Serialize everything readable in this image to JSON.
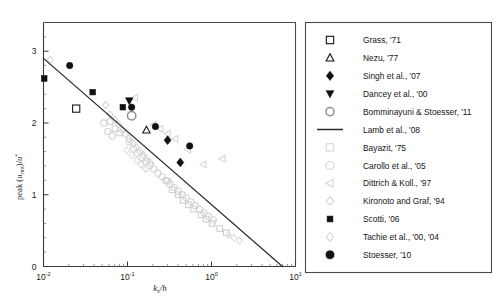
{
  "chart_data": {
    "type": "scatter",
    "title": "",
    "xlabel": "k_s/h",
    "ylabel": "peak (u_rms)/u*",
    "xscale": "log",
    "yscale": "linear",
    "xlim": [
      0.01,
      10
    ],
    "ylim": [
      0,
      3.4
    ],
    "grid": false,
    "legend_position": "right-outside",
    "xticks": [
      {
        "value": 0.01,
        "mantissa": "10",
        "exponent": "-2"
      },
      {
        "value": 0.1,
        "mantissa": "10",
        "exponent": "-1"
      },
      {
        "value": 1,
        "mantissa": "10",
        "exponent": "0"
      },
      {
        "value": 10,
        "mantissa": "10",
        "exponent": "1"
      }
    ],
    "yticks": [
      0,
      1,
      2,
      3
    ],
    "fit_line": {
      "name": "Lamb et al., '08",
      "x_start": 0.01,
      "y_start": 2.9,
      "x_end": 7.0,
      "y_end": 0.0
    },
    "series": [
      {
        "name": "Grass, '71",
        "marker": "square-open",
        "color": "#1a1a1a",
        "size": 7.2,
        "emphasis": "dark",
        "points": [
          [
            0.0245,
            2.2
          ]
        ]
      },
      {
        "name": "Nezu, '77",
        "marker": "triangle-up-open",
        "color": "#1a1a1a",
        "size": 7.0,
        "emphasis": "dark",
        "points": [
          [
            0.168,
            1.9
          ]
        ]
      },
      {
        "name": "Singh et al., '07",
        "marker": "diamond-filled",
        "color": "#111111",
        "size": 7.0,
        "emphasis": "dark",
        "points": [
          [
            0.3,
            1.76
          ],
          [
            0.425,
            1.45
          ]
        ]
      },
      {
        "name": "Dancey et al., '00",
        "marker": "triangle-down-filled",
        "color": "#111111",
        "size": 7.2,
        "emphasis": "dark",
        "points": [
          [
            0.105,
            2.31
          ]
        ]
      },
      {
        "name": "Bomminayuni & Stoesser, '11",
        "marker": "circle-open-grey",
        "color": "#8f8f8f",
        "size": 8.4,
        "emphasis": "mid",
        "points": [
          [
            0.112,
            2.1
          ]
        ]
      },
      {
        "name": "Bayazit, '75",
        "marker": "square-open",
        "color": "#cfcfcf",
        "size": 5.6,
        "emphasis": "light",
        "points": [
          [
            0.062,
            2.02
          ],
          [
            0.071,
            1.92
          ],
          [
            0.081,
            1.86
          ],
          [
            0.3,
            1.19
          ],
          [
            0.34,
            1.07
          ],
          [
            0.4,
            1.0
          ],
          [
            0.46,
            0.92
          ],
          [
            0.53,
            0.86
          ],
          [
            0.61,
            0.8
          ],
          [
            0.75,
            0.72
          ],
          [
            0.86,
            0.66
          ],
          [
            1.02,
            0.6
          ],
          [
            1.25,
            0.53
          ],
          [
            1.5,
            0.47
          ]
        ]
      },
      {
        "name": "Carollo et al., '05",
        "marker": "circle-open",
        "color": "#d2d2d2",
        "size": 6.2,
        "emphasis": "light",
        "points": [
          [
            0.052,
            2.0
          ],
          [
            0.058,
            1.88
          ],
          [
            0.066,
            1.82
          ],
          [
            0.105,
            1.74
          ],
          [
            0.118,
            1.64
          ],
          [
            0.132,
            1.58
          ],
          [
            0.15,
            1.52
          ],
          [
            0.168,
            1.46
          ],
          [
            0.185,
            1.41
          ],
          [
            0.205,
            1.36
          ],
          [
            0.23,
            1.3
          ],
          [
            0.26,
            1.25
          ],
          [
            0.285,
            1.2
          ],
          [
            0.32,
            1.15
          ],
          [
            0.36,
            1.1
          ],
          [
            0.4,
            1.05
          ],
          [
            0.45,
            1.0
          ],
          [
            0.5,
            0.96
          ],
          [
            0.57,
            0.9
          ],
          [
            0.64,
            0.85
          ],
          [
            0.72,
            0.8
          ],
          [
            0.81,
            0.75
          ],
          [
            0.92,
            0.7
          ],
          [
            1.05,
            0.65
          ]
        ]
      },
      {
        "name": "Dittrich & Koll., '97",
        "marker": "triangle-left-open",
        "color": "#d4d4d4",
        "size": 6.4,
        "emphasis": "light",
        "points": [
          [
            0.122,
            2.35
          ],
          [
            0.205,
            1.98
          ],
          [
            0.245,
            1.92
          ],
          [
            0.3,
            1.85
          ],
          [
            0.37,
            1.78
          ],
          [
            0.52,
            1.63
          ],
          [
            0.8,
            1.42
          ],
          [
            1.35,
            1.5
          ]
        ]
      },
      {
        "name": "Kironoto and Graf, '94",
        "marker": "diamond-open",
        "color": "#d4d4d4",
        "size": 6.0,
        "emphasis": "light",
        "points": [
          [
            0.012,
            2.88
          ],
          [
            0.055,
            2.25
          ],
          [
            0.062,
            2.12
          ],
          [
            0.07,
            2.05
          ],
          [
            0.078,
            1.98
          ],
          [
            0.086,
            1.9
          ],
          [
            0.095,
            1.84
          ],
          [
            0.104,
            1.78
          ],
          [
            0.115,
            1.72
          ],
          [
            0.127,
            1.66
          ],
          [
            0.14,
            1.6
          ],
          [
            0.155,
            1.55
          ],
          [
            0.17,
            1.5
          ],
          [
            0.19,
            1.44
          ]
        ]
      },
      {
        "name": "Scotti, '06",
        "marker": "square-filled",
        "color": "#111111",
        "size": 5.6,
        "emphasis": "dark",
        "points": [
          [
            0.0102,
            2.62
          ],
          [
            0.0385,
            2.43
          ],
          [
            0.088,
            2.22
          ]
        ]
      },
      {
        "name": "Tachie et al., '00, '04",
        "marker": "diamond-open",
        "color": "#dcdcdc",
        "size": 5.8,
        "emphasis": "light",
        "points": [
          [
            0.098,
            1.62
          ],
          [
            0.112,
            1.55
          ],
          [
            0.128,
            1.48
          ],
          [
            0.145,
            1.42
          ],
          [
            0.165,
            1.36
          ],
          [
            1.6,
            0.44
          ],
          [
            1.85,
            0.4
          ],
          [
            2.15,
            0.36
          ]
        ]
      },
      {
        "name": "Stoesser, '10",
        "marker": "circle-filled",
        "color": "#111111",
        "size": 6.4,
        "emphasis": "dark",
        "points": [
          [
            0.0205,
            2.8
          ],
          [
            0.112,
            2.22
          ],
          [
            0.215,
            1.95
          ],
          [
            0.55,
            1.68
          ]
        ]
      }
    ]
  },
  "legend": {
    "items": [
      {
        "label": "Grass, '71",
        "marker": "square-open",
        "tone": "dark"
      },
      {
        "label": "Nezu, '77",
        "marker": "triangle-up-open",
        "tone": "dark"
      },
      {
        "label": "Singh et al., '07",
        "marker": "diamond-filled",
        "tone": "dark"
      },
      {
        "label": "Dancey et al., '00",
        "marker": "triangle-down-filled",
        "tone": "dark"
      },
      {
        "label": "Bomminayuni & Stoesser, '11",
        "marker": "circle-open-grey",
        "tone": "mid"
      },
      {
        "label": "Lamb et al., '08",
        "marker": "line",
        "tone": "dark"
      },
      {
        "label": "Bayazit, '75",
        "marker": "square-open",
        "tone": "light"
      },
      {
        "label": "Carollo et al., '05",
        "marker": "circle-open",
        "tone": "light"
      },
      {
        "label": "Dittrich & Koll., '97",
        "marker": "triangle-left-open",
        "tone": "light"
      },
      {
        "label": "Kironoto and Graf, '94",
        "marker": "diamond-open",
        "tone": "light"
      },
      {
        "label": "Scotti, '06",
        "marker": "square-filled",
        "tone": "dark"
      },
      {
        "label": "Tachie et al., '00, '04",
        "marker": "diamond-open",
        "tone": "light"
      },
      {
        "label": "Stoesser, '10",
        "marker": "circle-filled",
        "tone": "dark"
      }
    ]
  },
  "colors": {
    "axis": "#3a3a3a",
    "frame": "#4a4a4a",
    "dark_marker": "#111111",
    "mid_marker": "#8f8f8f",
    "light_marker": "#d4d4d4",
    "fit_line": "#2b2b2b",
    "background": "#ffffff"
  }
}
